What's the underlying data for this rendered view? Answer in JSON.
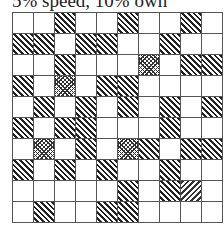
{
  "title": "5% speed, 10% own",
  "legend_patterns": {
    "empty": "white",
    "hatch": "diagonal-hatch",
    "dots": "crosshatch",
    "rhatch": "reverse-diagonal-hatch"
  },
  "grid": {
    "rows": 10,
    "cols": 10,
    "cells": [
      [
        "empty",
        "empty",
        "hatch",
        "empty",
        "empty",
        "hatch",
        "empty",
        "empty",
        "hatch",
        "empty"
      ],
      [
        "hatch",
        "hatch",
        "empty",
        "hatch",
        "hatch",
        "empty",
        "empty",
        "hatch",
        "empty",
        "empty"
      ],
      [
        "empty",
        "empty",
        "hatch",
        "empty",
        "empty",
        "empty",
        "dots",
        "empty",
        "hatch",
        "hatch"
      ],
      [
        "hatch",
        "empty",
        "dots",
        "empty",
        "hatch",
        "hatch",
        "empty",
        "empty",
        "empty",
        "empty"
      ],
      [
        "empty",
        "hatch",
        "empty",
        "hatch",
        "empty",
        "hatch",
        "empty",
        "hatch",
        "empty",
        "hatch"
      ],
      [
        "hatch",
        "empty",
        "hatch",
        "hatch",
        "empty",
        "empty",
        "empty",
        "hatch",
        "empty",
        "empty"
      ],
      [
        "empty",
        "dots",
        "empty",
        "hatch",
        "empty",
        "dots",
        "hatch",
        "empty",
        "hatch",
        "hatch"
      ],
      [
        "hatch",
        "empty",
        "hatch",
        "empty",
        "hatch",
        "empty",
        "empty",
        "hatch",
        "empty",
        "empty"
      ],
      [
        "empty",
        "empty",
        "empty",
        "empty",
        "empty",
        "hatch",
        "empty",
        "hatch",
        "rhatch",
        "empty"
      ],
      [
        "empty",
        "hatch",
        "empty",
        "empty",
        "hatch",
        "hatch",
        "empty",
        "empty",
        "empty",
        "empty"
      ]
    ]
  }
}
